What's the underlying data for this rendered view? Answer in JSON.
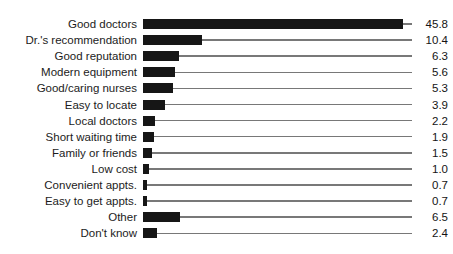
{
  "chart_data": {
    "type": "bar",
    "orientation": "horizontal",
    "title": "",
    "xlabel": "",
    "ylabel": "",
    "grid": false,
    "legend": false,
    "value_axis_range": [
      0,
      47.5
    ],
    "categories": [
      "Good doctors",
      "Dr.'s recommendation",
      "Good reputation",
      "Modern equipment",
      "Good/caring nurses",
      "Easy to locate",
      "Local doctors",
      "Short waiting time",
      "Family or friends",
      "Low cost",
      "Convenient appts.",
      "Easy to get appts.",
      "Other",
      "Don't know"
    ],
    "values": [
      45.8,
      10.4,
      6.3,
      5.6,
      5.3,
      3.9,
      2.2,
      1.9,
      1.5,
      1.0,
      0.7,
      0.7,
      6.5,
      2.4
    ],
    "value_labels": [
      "45.8",
      "10.4",
      "6.3",
      "5.6",
      "5.3",
      "3.9",
      "2.2",
      "1.9",
      "1.5",
      "1.0",
      "0.7",
      "0.7",
      "6.5",
      "2.4"
    ],
    "bar_color": "#161616",
    "leader_line_color": "#787878",
    "label_color": "#1c1c1c",
    "value_label_color": "#141414",
    "background_color": "#ffffff",
    "annotation_style": "value labels right-aligned at end of leader lines"
  }
}
